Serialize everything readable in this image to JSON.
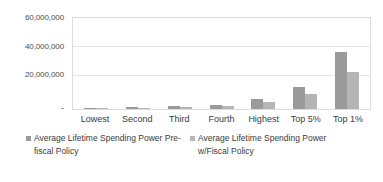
{
  "chart_data": {
    "type": "bar",
    "title": "",
    "xlabel": "",
    "ylabel": "",
    "grid": true,
    "legend_position": "bottom-left",
    "ylim": [
      0,
      60000000
    ],
    "ytick_labels": [
      "60,000,000",
      "40,000,000",
      "20,000,000",
      "-"
    ],
    "ytick_values": [
      60000000,
      40000000,
      20000000,
      0
    ],
    "categories": [
      "Lowest",
      "Second",
      "Third",
      "Fourth",
      "Highest",
      "Top 5%",
      "Top 1%"
    ],
    "series": [
      {
        "name": "Average Lifetime Spending Power Pre-fiscal Policy",
        "color": "#9a9a9a",
        "values": [
          300000,
          1000000,
          1700000,
          2600000,
          6600000,
          14000000,
          37000000
        ]
      },
      {
        "name": "Average Lifetime Spending Power w/Fiscal Policy",
        "color": "#b5b5b5",
        "values": [
          500000,
          900000,
          1400000,
          2000000,
          4500000,
          9800000,
          23800000
        ]
      }
    ]
  },
  "legend": {
    "entries": [
      {
        "label_line1": "Average Lifetime Spending Power",
        "label_line2": "Pre-fiscal Policy",
        "marker": "legend-swatch-square"
      },
      {
        "label_line1": "Average Lifetime Spending Power",
        "label_line2": "w/Fiscal Policy",
        "marker": "legend-swatch-square"
      }
    ]
  }
}
